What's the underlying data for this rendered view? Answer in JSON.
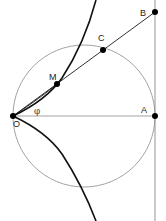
{
  "diagram": {
    "type": "geometry",
    "colors": {
      "background": "#ffffff",
      "curve": "#111111",
      "circle": "#999999",
      "lines": "#888888",
      "line_ob": "#333333",
      "points": "#000000"
    },
    "points": [
      {
        "id": "O",
        "label": "O",
        "x": 13,
        "y": 116
      },
      {
        "id": "M",
        "label": "M",
        "x": 57,
        "y": 84
      },
      {
        "id": "C",
        "label": "C",
        "x": 103,
        "y": 50
      },
      {
        "id": "B",
        "label": "B",
        "x": 155,
        "y": 12
      },
      {
        "id": "A",
        "label": "A",
        "x": 155,
        "y": 116
      }
    ],
    "angle_label": "φ",
    "circle": {
      "cx": 84,
      "cy": 116,
      "r": 71
    }
  }
}
